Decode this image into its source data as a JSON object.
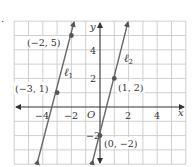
{
  "figure": {
    "marker": ".",
    "axis_labels": {
      "x": "x",
      "y": "y",
      "origin": "O"
    },
    "x_ticks": [
      {
        "value": -4,
        "label": "−4"
      },
      {
        "value": -2,
        "label": "−2"
      },
      {
        "value": 2,
        "label": "2"
      },
      {
        "value": 4,
        "label": "4"
      }
    ],
    "y_ticks": [
      {
        "value": 4,
        "label": "4"
      },
      {
        "value": 2,
        "label": "2"
      },
      {
        "value": -2,
        "label": "−2"
      }
    ],
    "lines": [
      {
        "name": "ℓ",
        "subscript": "1",
        "points": [
          [
            -2,
            5
          ],
          [
            -3,
            1
          ]
        ]
      },
      {
        "name": "ℓ",
        "subscript": "2",
        "points": [
          [
            1,
            2
          ],
          [
            0,
            -2
          ]
        ]
      }
    ],
    "points": [
      {
        "label": "(−2, 5)",
        "x": -2,
        "y": 5
      },
      {
        "label": "(−3, 1)",
        "x": -3,
        "y": 1
      },
      {
        "label": "(1, 2)",
        "x": 1,
        "y": 2
      },
      {
        "label": "(0, −2)",
        "x": 0,
        "y": -2
      }
    ],
    "grid": {
      "xmin": -6,
      "xmax": 6,
      "ymin": -4,
      "ymax": 6
    },
    "colors": {
      "grid": "#cccccc",
      "axis": "#444444",
      "line": "#6a6a6a",
      "point": "#555555",
      "text": "#333333"
    }
  }
}
